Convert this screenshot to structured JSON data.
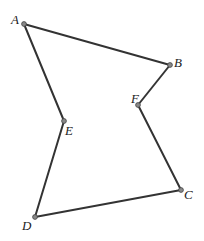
{
  "diagram": {
    "type": "polygon",
    "points": [
      {
        "id": "A",
        "label": "A",
        "x": 24,
        "y": 24,
        "lx": 11,
        "ly": 24
      },
      {
        "id": "B",
        "label": "B",
        "x": 170,
        "y": 65,
        "lx": 174,
        "ly": 67
      },
      {
        "id": "C",
        "label": "C",
        "x": 181,
        "y": 190,
        "lx": 184,
        "ly": 199
      },
      {
        "id": "D",
        "label": "D",
        "x": 35,
        "y": 217,
        "lx": 22,
        "ly": 230
      },
      {
        "id": "E",
        "label": "E",
        "x": 64,
        "y": 121,
        "lx": 65,
        "ly": 135
      },
      {
        "id": "F",
        "label": "F",
        "x": 138,
        "y": 105,
        "lx": 131,
        "ly": 103
      }
    ],
    "edges": [
      [
        "A",
        "B"
      ],
      [
        "B",
        "F"
      ],
      [
        "F",
        "C"
      ],
      [
        "C",
        "D"
      ],
      [
        "D",
        "E"
      ],
      [
        "E",
        "A"
      ]
    ],
    "colors": {
      "edge": "#333333",
      "point": "#888888",
      "background": "#ffffff"
    }
  }
}
